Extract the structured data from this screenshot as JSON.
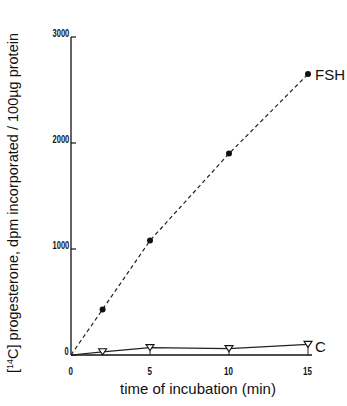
{
  "chart_data": {
    "type": "line",
    "title": "",
    "xlabel": "time of incubation (min)",
    "ylabel": "[14C] progesterone, dpm incorporated / 100µg protein",
    "xlim": [
      0,
      15
    ],
    "ylim": [
      0,
      3000
    ],
    "x_ticks": [
      "0",
      "5",
      "10",
      "15"
    ],
    "y_ticks": [
      "0",
      "1000",
      "2000",
      "3000"
    ],
    "grid": false,
    "legend_position": "inline-right",
    "series": [
      {
        "name": "FSH",
        "style": "dashed",
        "marker": "filled-circle",
        "x": [
          0,
          2,
          5,
          10,
          15
        ],
        "values": [
          0,
          430,
          1080,
          1900,
          2650
        ]
      },
      {
        "name": "C",
        "style": "solid",
        "marker": "open-triangle-down",
        "x": [
          0,
          2,
          5,
          10,
          15
        ],
        "values": [
          0,
          30,
          70,
          60,
          100
        ]
      }
    ]
  },
  "labels": {
    "ylabel_prefix": "[",
    "ylabel_sup": "14",
    "ylabel_rest": "C] progesterone, dpm incorporated / 100µg protein",
    "xlabel": "time of incubation (min)",
    "series_fsh": "FSH",
    "series_c": "C"
  }
}
